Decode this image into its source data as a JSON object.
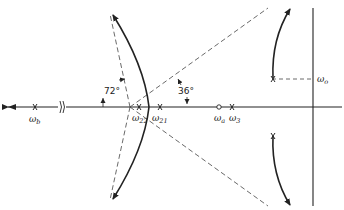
{
  "diagram": {
    "type": "root-locus",
    "colors": {
      "ink": "#222222",
      "dashed": "#444444",
      "background": "#ffffff"
    },
    "angles": [
      {
        "label": "72°"
      },
      {
        "label": "36°"
      }
    ],
    "axis_break_symbol": "≈",
    "poles": [
      {
        "name": "ω",
        "sub": "b"
      },
      {
        "name": "ω",
        "sub": "22"
      },
      {
        "name": "ω",
        "sub": "21"
      },
      {
        "name": "ω",
        "sub": "3"
      }
    ],
    "zeros": [
      {
        "name": "ω",
        "sub": "a"
      }
    ],
    "imag_label": {
      "name": "ω",
      "sub": "o"
    }
  }
}
